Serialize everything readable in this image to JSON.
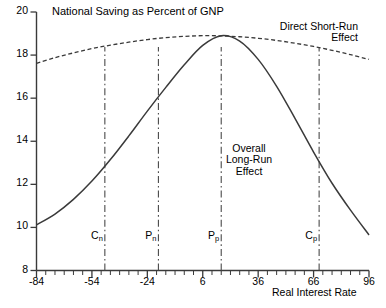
{
  "chart_data": {
    "type": "line",
    "title": "National Saving as Percent of GNP",
    "xlabel": "Real Interest Rate",
    "ylabel": "",
    "xlim": [
      -84,
      96
    ],
    "ylim": [
      8,
      20
    ],
    "xticks": [
      "-84",
      "-54",
      "-24",
      "6",
      "36",
      "66",
      "96"
    ],
    "xtick_values": [
      -84,
      -54,
      -24,
      6,
      36,
      66,
      96
    ],
    "yticks": [
      "20",
      "18",
      "16",
      "14",
      "12",
      "10",
      "8"
    ],
    "ytick_values": [
      20,
      18,
      16,
      14,
      12,
      10,
      8
    ],
    "grid": false,
    "legend": "none",
    "series": [
      {
        "name": "Direct Short-Run Effect",
        "style": "dashed",
        "x": [
          -84,
          -74,
          -64,
          -54,
          -44,
          -34,
          -24,
          -14,
          -4,
          6,
          16,
          26,
          36,
          46,
          56,
          66,
          76,
          86,
          96
        ],
        "y": [
          17.62,
          17.88,
          18.1,
          18.3,
          18.46,
          18.6,
          18.72,
          18.81,
          18.87,
          18.9,
          18.89,
          18.85,
          18.78,
          18.68,
          18.55,
          18.4,
          18.22,
          18.02,
          17.8
        ]
      },
      {
        "name": "Overall Long-Run Effect",
        "style": "solid",
        "x": [
          -84,
          -74,
          -64,
          -54,
          -44,
          -34,
          -24,
          -14,
          -4,
          6,
          16,
          26,
          36,
          46,
          56,
          66,
          76,
          86,
          96
        ],
        "y": [
          10.12,
          10.62,
          11.3,
          12.15,
          13.15,
          14.25,
          15.4,
          16.5,
          17.55,
          18.45,
          18.9,
          18.65,
          17.8,
          16.55,
          15.05,
          13.5,
          12.05,
          10.8,
          9.65
        ]
      }
    ],
    "annotations": [
      {
        "name": "direct-short-run-effect",
        "lines": [
          "Direct Short-Run",
          "Effect"
        ],
        "align": "right"
      },
      {
        "name": "overall-long-run-effect",
        "lines": [
          "Overall",
          "Long-Run",
          "Effect"
        ],
        "align": "center"
      }
    ],
    "vertical_markers": [
      {
        "id": "cn",
        "label": "C",
        "sub": "n",
        "x_value": -47
      },
      {
        "id": "pn",
        "label": "P",
        "sub": "n",
        "x_value": -18
      },
      {
        "id": "pp",
        "label": "P",
        "sub": "p",
        "x_value": 16
      },
      {
        "id": "cp",
        "label": "C",
        "sub": "p",
        "x_value": 69
      }
    ],
    "colors": {
      "axis": "#3a3a3a",
      "curve": "#3a3a3a",
      "marker": "#4a4a4a",
      "background": "#ffffff"
    }
  }
}
